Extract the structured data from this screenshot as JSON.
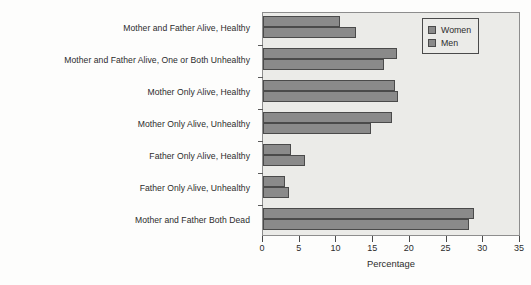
{
  "chart_data": {
    "type": "bar",
    "orientation": "horizontal",
    "title": "",
    "xlabel": "Percentage",
    "ylabel": "",
    "xlim": [
      0,
      35
    ],
    "xticks": [
      0,
      5,
      10,
      15,
      20,
      25,
      30,
      35
    ],
    "grid": false,
    "legend_position": "top-right",
    "categories": [
      "Mother and Father Alive, Healthy",
      "Mother and Father Alive, One or Both Unhealthy",
      "Mother Only Alive, Healthy",
      "Mother Only Alive, Unhealthy",
      "Father Only Alive, Healthy",
      "Father Only Alive, Unhealthy",
      "Mother and Father Both Dead"
    ],
    "series": [
      {
        "name": "Women",
        "color": "#8a8a8a",
        "values": [
          10.5,
          18.3,
          18.0,
          17.6,
          3.8,
          3.0,
          28.7
        ]
      },
      {
        "name": "Men",
        "color": "#8a8a8a",
        "values": [
          12.7,
          16.5,
          18.4,
          14.7,
          5.7,
          3.6,
          28.0
        ]
      }
    ]
  },
  "legend": {
    "items": [
      {
        "label": "Women"
      },
      {
        "label": "Men"
      }
    ]
  },
  "axis": {
    "x_tick_labels": [
      "0",
      "5",
      "10",
      "15",
      "20",
      "25",
      "30",
      "35"
    ],
    "x_axis_title": "Percentage"
  },
  "colors": {
    "bar_fill": "#8a8a8a",
    "bar_edge": "#4a4a4a",
    "plot_background": "#ebebe8",
    "text": "#2c2c2c"
  }
}
